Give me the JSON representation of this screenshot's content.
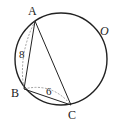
{
  "figure": {
    "type": "geometry-diagram",
    "circle_label": "O",
    "points": {
      "A": "A",
      "B": "B",
      "C": "C"
    },
    "segment_labels": {
      "AB": "8",
      "BC": "6"
    },
    "segments": [
      "AB",
      "AC",
      "BC"
    ],
    "dashed_arcs": [
      "AB",
      "BC"
    ],
    "colors": {
      "stroke": "#222222",
      "dashed": "#888888",
      "background": "#ffffff"
    }
  }
}
